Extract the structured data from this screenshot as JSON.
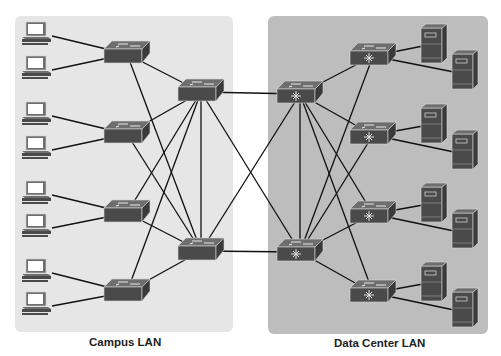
{
  "diagram": {
    "colors": {
      "campus_panel": "#e6e6e6",
      "datacenter_panel": "#bdbdbd",
      "link": "#111111",
      "device_top": "#6e6e6e",
      "device_front": "#4a4a4a",
      "device_edge": "#d8d8d8"
    },
    "panels": [
      {
        "id": "campus",
        "label": "Campus LAN",
        "x": 15,
        "y": 16,
        "w": 218,
        "h": 316,
        "label_x": 89,
        "label_y": 347
      },
      {
        "id": "datacenter",
        "label": "Data Center LAN",
        "x": 268,
        "y": 16,
        "w": 220,
        "h": 318,
        "label_x": 334,
        "label_y": 348
      }
    ],
    "pcs": [
      {
        "id": "pc1",
        "x": 22,
        "y": 22
      },
      {
        "id": "pc2",
        "x": 22,
        "y": 56
      },
      {
        "id": "pc3",
        "x": 22,
        "y": 102
      },
      {
        "id": "pc4",
        "x": 22,
        "y": 136
      },
      {
        "id": "pc5",
        "x": 22,
        "y": 181
      },
      {
        "id": "pc6",
        "x": 22,
        "y": 214
      },
      {
        "id": "pc7",
        "x": 22,
        "y": 259
      },
      {
        "id": "pc8",
        "x": 22,
        "y": 292
      }
    ],
    "switches": [
      {
        "id": "acc1",
        "role": "access",
        "x": 104,
        "y": 41
      },
      {
        "id": "acc2",
        "role": "access",
        "x": 104,
        "y": 121
      },
      {
        "id": "acc3",
        "role": "access",
        "x": 104,
        "y": 200
      },
      {
        "id": "acc4",
        "role": "access",
        "x": 104,
        "y": 279
      },
      {
        "id": "dist1",
        "role": "distribution",
        "x": 178,
        "y": 79
      },
      {
        "id": "dist2",
        "role": "distribution",
        "x": 178,
        "y": 238
      },
      {
        "id": "core1",
        "role": "multilayer",
        "x": 277,
        "y": 81
      },
      {
        "id": "core2",
        "role": "multilayer",
        "x": 277,
        "y": 239
      },
      {
        "id": "dc1",
        "role": "multilayer",
        "x": 350,
        "y": 43
      },
      {
        "id": "dc2",
        "role": "multilayer",
        "x": 350,
        "y": 122
      },
      {
        "id": "dc3",
        "role": "multilayer",
        "x": 350,
        "y": 201
      },
      {
        "id": "dc4",
        "role": "multilayer",
        "x": 350,
        "y": 280
      }
    ],
    "servers": [
      {
        "id": "srv1",
        "x": 421,
        "y": 24
      },
      {
        "id": "srv2",
        "x": 452,
        "y": 50
      },
      {
        "id": "srv3",
        "x": 421,
        "y": 104
      },
      {
        "id": "srv4",
        "x": 452,
        "y": 130
      },
      {
        "id": "srv5",
        "x": 421,
        "y": 183
      },
      {
        "id": "srv6",
        "x": 452,
        "y": 209
      },
      {
        "id": "srv7",
        "x": 421,
        "y": 262
      },
      {
        "id": "srv8",
        "x": 452,
        "y": 288
      }
    ],
    "links": [
      {
        "from": "pc1",
        "to": "acc1"
      },
      {
        "from": "pc2",
        "to": "acc1"
      },
      {
        "from": "pc3",
        "to": "acc2"
      },
      {
        "from": "pc4",
        "to": "acc2"
      },
      {
        "from": "pc5",
        "to": "acc3"
      },
      {
        "from": "pc6",
        "to": "acc3"
      },
      {
        "from": "pc7",
        "to": "acc4"
      },
      {
        "from": "pc8",
        "to": "acc4"
      },
      {
        "from": "acc1",
        "to": "dist1"
      },
      {
        "from": "acc1",
        "to": "dist2"
      },
      {
        "from": "acc2",
        "to": "dist1"
      },
      {
        "from": "acc2",
        "to": "dist2"
      },
      {
        "from": "acc3",
        "to": "dist1"
      },
      {
        "from": "acc3",
        "to": "dist2"
      },
      {
        "from": "acc4",
        "to": "dist1"
      },
      {
        "from": "acc4",
        "to": "dist2"
      },
      {
        "from": "dist1",
        "to": "dist2"
      },
      {
        "from": "dist1",
        "to": "core1"
      },
      {
        "from": "dist1",
        "to": "core2"
      },
      {
        "from": "dist2",
        "to": "core1"
      },
      {
        "from": "dist2",
        "to": "core2"
      },
      {
        "from": "core1",
        "to": "core2"
      },
      {
        "from": "core1",
        "to": "dc1"
      },
      {
        "from": "core1",
        "to": "dc2"
      },
      {
        "from": "core1",
        "to": "dc3"
      },
      {
        "from": "core1",
        "to": "dc4"
      },
      {
        "from": "core2",
        "to": "dc1"
      },
      {
        "from": "core2",
        "to": "dc2"
      },
      {
        "from": "core2",
        "to": "dc3"
      },
      {
        "from": "core2",
        "to": "dc4"
      },
      {
        "from": "dc1",
        "to": "srv1"
      },
      {
        "from": "dc1",
        "to": "srv2"
      },
      {
        "from": "dc2",
        "to": "srv3"
      },
      {
        "from": "dc2",
        "to": "srv4"
      },
      {
        "from": "dc3",
        "to": "srv5"
      },
      {
        "from": "dc3",
        "to": "srv6"
      },
      {
        "from": "dc4",
        "to": "srv7"
      },
      {
        "from": "dc4",
        "to": "srv8"
      }
    ]
  }
}
